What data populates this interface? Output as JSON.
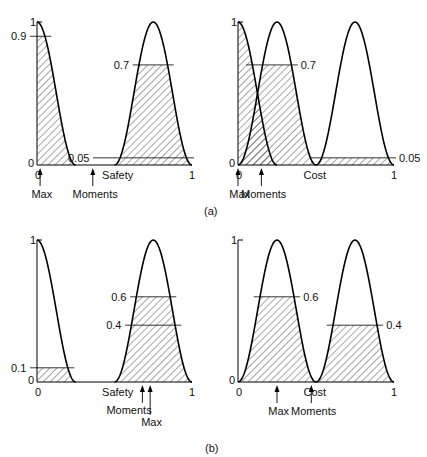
{
  "figure": {
    "caption_a": "(a)",
    "caption_b": "(b)"
  },
  "chart_data": [
    {
      "id": "a-safety",
      "type": "area",
      "panel": "(a) left",
      "xlabel": "Safety",
      "x_ticks": [
        "0",
        "1"
      ],
      "y_ticks": [
        "0",
        "1"
      ],
      "ylim": [
        0,
        1
      ],
      "xlim": [
        0,
        1
      ],
      "series": [
        {
          "name": "low",
          "shape": "half-bell",
          "x_start": 0.0,
          "x_end": 0.25,
          "peak_x": 0.0,
          "peak": 1.0,
          "clip": 0.9
        },
        {
          "name": "high",
          "shape": "bell",
          "x_start": 0.5,
          "x_end": 1.0,
          "peak_x": 0.75,
          "peak": 1.0,
          "clip": 0.7
        }
      ],
      "level_lines": [
        {
          "value": 0.9,
          "label": "0.9",
          "side": "left"
        },
        {
          "value": 0.7,
          "label": "0.7",
          "side": "left"
        },
        {
          "value": 0.05,
          "label": "0.05",
          "side": "left"
        }
      ],
      "markers": [
        {
          "label": "Max",
          "x": 0.02
        },
        {
          "label": "Moments",
          "x": 0.36
        }
      ]
    },
    {
      "id": "a-cost",
      "type": "area",
      "panel": "(a) right",
      "xlabel": "Cost",
      "x_ticks": [
        "0",
        "1"
      ],
      "y_ticks": [
        "0",
        "1"
      ],
      "ylim": [
        0,
        1
      ],
      "xlim": [
        0,
        1
      ],
      "series": [
        {
          "name": "low",
          "shape": "half-bell",
          "x_start": 0.0,
          "x_end": 0.25,
          "peak_x": 0.0,
          "peak": 1.0,
          "clip": 1.0
        },
        {
          "name": "medium",
          "shape": "bell",
          "x_start": 0.0,
          "x_end": 0.5,
          "peak_x": 0.25,
          "peak": 1.0,
          "clip": 0.7
        },
        {
          "name": "high",
          "shape": "bell",
          "x_start": 0.5,
          "x_end": 1.0,
          "peak_x": 0.75,
          "peak": 1.0,
          "clip": 0.05
        }
      ],
      "level_lines": [
        {
          "value": 0.7,
          "label": "0.7",
          "side": "right"
        },
        {
          "value": 0.05,
          "label": "0.05",
          "side": "right"
        }
      ],
      "markers": [
        {
          "label": "Max",
          "x": 0.0
        },
        {
          "label": "Moments",
          "x": 0.15
        }
      ]
    },
    {
      "id": "b-safety",
      "type": "area",
      "panel": "(b) left",
      "xlabel": "Safety",
      "x_ticks": [
        "0",
        "1"
      ],
      "y_ticks": [
        "0",
        "1"
      ],
      "ylim": [
        0,
        1
      ],
      "xlim": [
        0,
        1
      ],
      "series": [
        {
          "name": "low",
          "shape": "half-bell",
          "x_start": 0.0,
          "x_end": 0.25,
          "peak_x": 0.0,
          "peak": 1.0,
          "clip": 0.1
        },
        {
          "name": "high",
          "shape": "bell",
          "x_start": 0.5,
          "x_end": 1.0,
          "peak_x": 0.75,
          "peak": 1.0,
          "clip": 0.6
        }
      ],
      "level_lines": [
        {
          "value": 0.6,
          "label": "0.6",
          "side": "left"
        },
        {
          "value": 0.4,
          "label": "0.4",
          "side": "left"
        },
        {
          "value": 0.1,
          "label": "0.1",
          "side": "left"
        }
      ],
      "markers": [
        {
          "label": "Moments",
          "x": 0.68
        },
        {
          "label": "Max",
          "x": 0.73
        }
      ]
    },
    {
      "id": "b-cost",
      "type": "area",
      "panel": "(b) right",
      "xlabel": "Cost",
      "x_ticks": [
        "0",
        "1"
      ],
      "y_ticks": [
        "0",
        "1"
      ],
      "ylim": [
        0,
        1
      ],
      "xlim": [
        0,
        1
      ],
      "series": [
        {
          "name": "medium",
          "shape": "bell",
          "x_start": 0.0,
          "x_end": 0.5,
          "peak_x": 0.25,
          "peak": 1.0,
          "clip": 0.6
        },
        {
          "name": "high",
          "shape": "bell",
          "x_start": 0.5,
          "x_end": 1.0,
          "peak_x": 0.75,
          "peak": 1.0,
          "clip": 0.4
        }
      ],
      "level_lines": [
        {
          "value": 0.6,
          "label": "0.6",
          "side": "right"
        },
        {
          "value": 0.4,
          "label": "0.4",
          "side": "right"
        }
      ],
      "markers": [
        {
          "label": "Max",
          "x": 0.25
        },
        {
          "label": "Moments",
          "x": 0.47
        }
      ]
    }
  ]
}
